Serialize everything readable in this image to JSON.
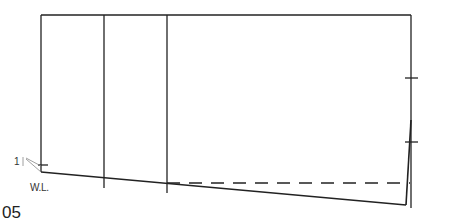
{
  "labels": {
    "waterline": "W.L.",
    "angle_marker": "1",
    "figure_number": "05"
  },
  "colors": {
    "stroke": "#222222",
    "annotation": "#888888"
  }
}
